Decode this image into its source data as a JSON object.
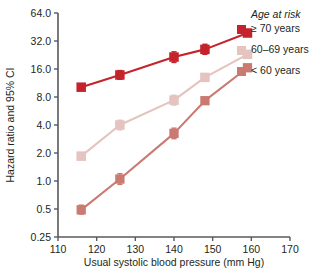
{
  "chart_data": {
    "type": "line",
    "title": "",
    "xlabel": "Usual systolic blood pressure (mm Hg)",
    "ylabel": "Hazard ratio and 95% CI",
    "yscale": "log2",
    "xlim": [
      110,
      170
    ],
    "ylim": [
      0.25,
      64.0
    ],
    "grid": false,
    "legend_position": "top-right",
    "legend_title": "Age at risk",
    "xticks": [
      110,
      120,
      130,
      140,
      150,
      160,
      170
    ],
    "xtick_labels": [
      "110",
      "120",
      "130",
      "140",
      "150",
      "160",
      "170"
    ],
    "yticks": [
      64.0,
      32.0,
      16.0,
      8.0,
      4.0,
      2.0,
      1.0,
      0.5,
      0.25
    ],
    "ytick_labels": [
      "64.0",
      "32.0",
      "16.0",
      "8.0",
      "4.0",
      "2.0",
      "1.0",
      "0.5",
      "0.25"
    ],
    "series": [
      {
        "name": "≥ 70 years",
        "color": "#C5232B",
        "x": [
          116,
          126,
          140,
          148,
          159
        ],
        "values": [
          10.2,
          13.8,
          21.5,
          26.0,
          39.0
        ],
        "ci_low": [
          9.6,
          12.4,
          18.8,
          23.0,
          36.0
        ],
        "ci_high": [
          10.9,
          15.4,
          24.5,
          29.5,
          42.0
        ]
      },
      {
        "name": "60–69 years",
        "color": "#E5C3BE",
        "x": [
          116,
          126,
          140,
          148,
          159
        ],
        "values": [
          1.85,
          4.0,
          7.4,
          13.0,
          23.0
        ],
        "ci_low": [
          1.7,
          3.55,
          6.55,
          12.0,
          21.5
        ],
        "ci_high": [
          2.02,
          4.5,
          8.35,
          14.1,
          24.6
        ]
      },
      {
        "name": "< 60 years",
        "color": "#CB7A72",
        "x": [
          116,
          126,
          140,
          148,
          159
        ],
        "values": [
          0.49,
          1.05,
          3.25,
          7.3,
          16.5
        ],
        "ci_low": [
          0.44,
          0.92,
          2.85,
          6.7,
          15.3
        ],
        "ci_high": [
          0.55,
          1.2,
          3.7,
          7.9,
          17.8
        ]
      }
    ]
  },
  "legend": {
    "title": "Age at risk",
    "entries": [
      {
        "label": "≥ 70 years",
        "color": "#C5232B"
      },
      {
        "label": "60–69 years",
        "color": "#E5C3BE"
      },
      {
        "label": "< 60 years",
        "color": "#CB7A72"
      }
    ]
  },
  "axes": {
    "x_title": "Usual systolic blood pressure (mm Hg)",
    "y_title": "Hazard ratio and 95% CI"
  },
  "colors": {
    "axis": "#58595B",
    "text": "#231f20",
    "background": "#ffffff"
  }
}
